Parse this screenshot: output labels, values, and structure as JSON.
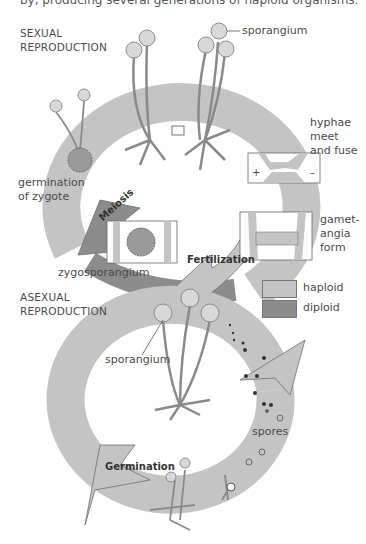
{
  "caption_fragment": "by, producing several generations of haploid organisms.",
  "sexual": {
    "title_line1": "SEXUAL",
    "title_line2": "REPRODUCTION",
    "sporangium": "sporangium",
    "hyphae_1": "hyphae",
    "hyphae_2": "meet",
    "hyphae_3": "and fuse",
    "plus": "+",
    "minus": "–",
    "gamet_1": "gamet-",
    "gamet_2": "angia",
    "gamet_3": "form",
    "fertilization": "Fertilization",
    "zygosporangium": "zygosporangium",
    "meiosis": "Meiosis",
    "germ_1": "germination",
    "germ_2": "of zygote"
  },
  "asexual": {
    "title_line1": "ASEXUAL",
    "title_line2": "REPRODUCTION",
    "sporangium": "sporangium",
    "spores": "spores",
    "germination": "Germination"
  },
  "legend": {
    "items": [
      {
        "label": "haploid",
        "color": "#c4c4c4"
      },
      {
        "label": "diploid",
        "color": "#8c8c8c"
      }
    ]
  },
  "colors": {
    "haploid": "#c4c4c4",
    "diploid": "#8c8c8c",
    "outline": "#6e6e6e",
    "sporangium": "#d8d8d8"
  }
}
